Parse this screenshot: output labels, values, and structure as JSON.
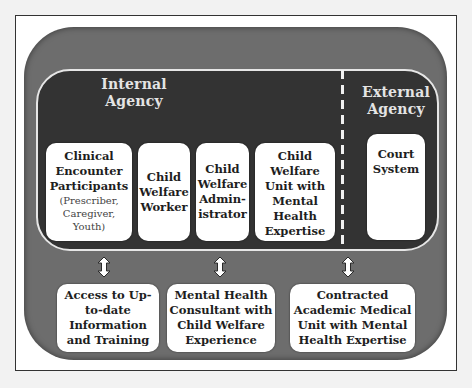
{
  "diagram": {
    "internal_agency": {
      "title_lines": [
        "Internal",
        "Agency"
      ],
      "boxes": [
        {
          "lines": [
            "Clinical",
            "Encounter",
            "Participants"
          ],
          "sub_lines": [
            "(Prescriber,",
            "Caregiver,",
            "Youth)"
          ]
        },
        {
          "lines": [
            "Child",
            "Welfare",
            "Worker"
          ]
        },
        {
          "lines": [
            "Child",
            "Welfare",
            "Admin-",
            "istrator"
          ]
        },
        {
          "lines": [
            "Child",
            "Welfare",
            "Unit with",
            "Mental",
            "Health",
            "Expertise"
          ]
        }
      ]
    },
    "external_agency": {
      "title_lines": [
        "External",
        "Agency"
      ],
      "boxes": [
        {
          "lines": [
            "Court",
            "System"
          ]
        }
      ]
    },
    "support_resources": [
      {
        "lines": [
          "Access to Up-",
          "to-date",
          "Information",
          "and Training"
        ]
      },
      {
        "lines": [
          "Mental Health",
          "Consultant with",
          "Child Welfare",
          "Experience"
        ]
      },
      {
        "lines": [
          "Contracted",
          "Academic Medical",
          "Unit with Mental",
          "Health Expertise"
        ]
      }
    ],
    "connectors": [
      {
        "type": "bidirectional-arrow",
        "from": "internal_agency",
        "to": "support_resources.0"
      },
      {
        "type": "bidirectional-arrow",
        "from": "internal_agency",
        "to": "support_resources.1"
      },
      {
        "type": "bidirectional-arrow",
        "from": "internal_agency",
        "to": "support_resources.2"
      }
    ],
    "colors": {
      "outer_panel": "#6d6d6d",
      "inner_panel": "#333333",
      "box_fill": "#ffffff",
      "title_text": "#e4e4e4",
      "divider": "#f0f0f0"
    }
  }
}
